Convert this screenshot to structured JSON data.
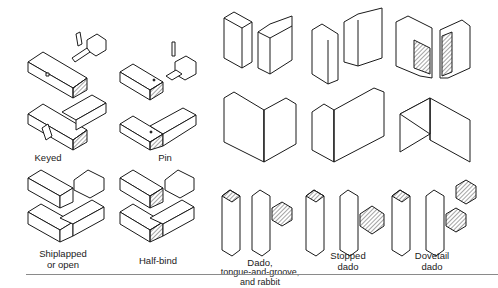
{
  "figure": {
    "labels": {
      "keyed": "Keyed",
      "pin": "Pin",
      "shiplapped_1": "Shiplapped",
      "shiplapped_2": "or open",
      "halfbind": "Half-bind",
      "dado_1": "Dado,",
      "dado_2": "tongue-and-groove,",
      "dado_3": "and rabbit",
      "stopped_1": "Stopped",
      "stopped_2": "dado",
      "dovetail_1": "Dovetail",
      "dovetail_2": "dado"
    },
    "colors": {
      "line": "#1a1a1a",
      "background": "#ffffff",
      "rule": "#8a8a8a"
    }
  }
}
